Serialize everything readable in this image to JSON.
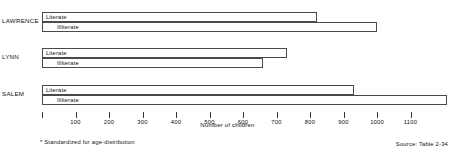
{
  "chart_data": {
    "type": "bar",
    "orientation": "horizontal",
    "title": "",
    "xlabel": "Number of children",
    "ylabel": "",
    "xlim": [
      0,
      1250
    ],
    "grid": false,
    "legend": "inline-bar-labels",
    "xticks": [
      0,
      100,
      200,
      300,
      400,
      500,
      600,
      700,
      800,
      900,
      1000,
      1100
    ],
    "xticklabels": [
      "",
      "100",
      "200",
      "300",
      "400",
      "500",
      "600",
      "700",
      "800",
      "900",
      "1000",
      "1100"
    ],
    "categories": [
      "LAWRENCE",
      "LYNN",
      "SALEM"
    ],
    "series": [
      {
        "name": "Literate",
        "values": [
          820,
          730,
          930
        ]
      },
      {
        "name": "Illiterate",
        "values": [
          1000,
          660,
          1210
        ]
      }
    ],
    "groups": [
      {
        "label": "LAWRENCE",
        "bars": [
          {
            "label": "Literate",
            "value": 820
          },
          {
            "label": "Illiterate",
            "value": 1000
          }
        ]
      },
      {
        "label": "LYNN",
        "bars": [
          {
            "label": "Literate",
            "value": 730
          },
          {
            "label": "Illiterate",
            "value": 660
          }
        ]
      },
      {
        "label": "SALEM",
        "bars": [
          {
            "label": "Literate",
            "value": 930
          },
          {
            "label": "Illiterate",
            "value": 1210
          }
        ]
      }
    ],
    "footnote": "* Standardized for age-distribution",
    "source": "Source: Table 2-34",
    "colors": {
      "bar_fill": "#ffffff",
      "bar_stroke": "#4a4a4a",
      "text": "#111111",
      "background": "#ffffff"
    }
  }
}
